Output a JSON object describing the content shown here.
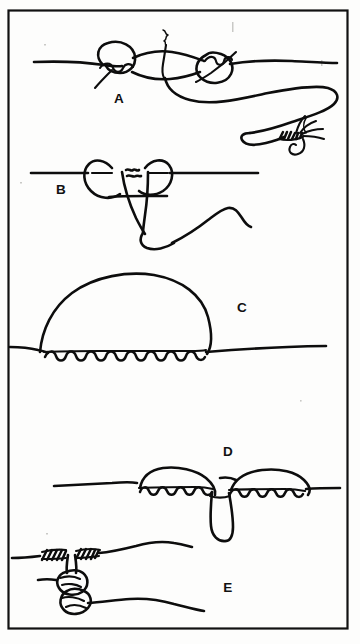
{
  "figure": {
    "kind": "line-drawing-illustration",
    "background_color": "#fdfdfc",
    "ink_color": "#0d0d0d",
    "border": {
      "present": true,
      "shape": "rectangle",
      "color": "#111111",
      "x": 8,
      "y": 10,
      "width": 340,
      "height": 619
    },
    "panel_count": 5
  },
  "panels": [
    {
      "id": "A",
      "label": "A",
      "label_x": 119,
      "label_y": 103,
      "description": "Two overhand knots formed in a monofilament line with a standing line running left and right; a tag end loops down to the right and terminates in an artificial fly on a hook.",
      "has_fly": true,
      "has_coils": false
    },
    {
      "id": "B",
      "label": "B",
      "label_x": 61,
      "label_y": 194,
      "description": "The knot drawn up into a double loop with the tag end passing through and trailing down to the lower right.",
      "has_fly": false,
      "has_coils": false
    },
    {
      "id": "C",
      "label": "C",
      "label_x": 242,
      "label_y": 312,
      "description": "A large open loop standing above the line, its base formed by a long series of barrel wraps along the standing line.",
      "has_fly": false,
      "has_coils": true
    },
    {
      "id": "D",
      "label": "D",
      "label_x": 228,
      "label_y": 456,
      "description": "The loop pulled down into two opposing coiled barrels that meet at the centre, leaving a small tag loop hanging below.",
      "has_fly": false,
      "has_coils": true
    },
    {
      "id": "E",
      "label": "E",
      "label_x": 228,
      "label_y": 592,
      "description": "The finished knot tightened down: short wrapped coils on the upper line with the tippet knot cinched below and lines exiting left and right.",
      "has_fly": false,
      "has_coils": true
    }
  ],
  "labels": {
    "a": "A",
    "b": "B",
    "c": "C",
    "d": "D",
    "e": "E"
  }
}
